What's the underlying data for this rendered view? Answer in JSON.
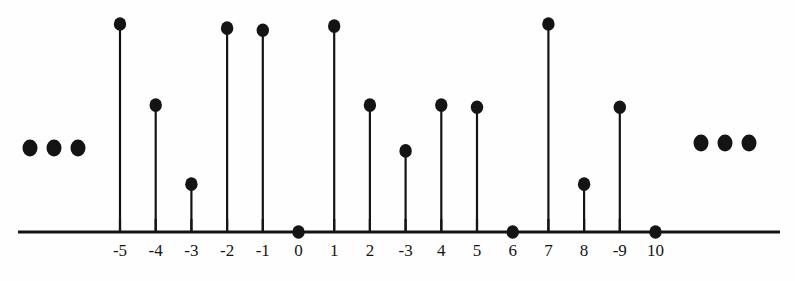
{
  "chart_data": {
    "type": "scatter",
    "plot_style": "stem",
    "title": "",
    "subtitle": "",
    "xlabel": "",
    "ylabel": "",
    "grid": false,
    "legend": null,
    "axis": {
      "baseline_visible": true,
      "ticks_visible": true,
      "y_axis_visible": false,
      "xlim": [
        -6.2,
        11.5
      ],
      "ylim": [
        0,
        1.05
      ]
    },
    "tick_labels": [
      "-5",
      "-4",
      "-3",
      "-2",
      "-1",
      "0",
      "1",
      "2",
      "-3",
      "4",
      "5",
      "6",
      "7",
      "8",
      "-9",
      "10"
    ],
    "categories": [
      "-5",
      "-4",
      "-3",
      "-2",
      "-1",
      "0",
      "1",
      "2",
      "-3",
      "4",
      "5",
      "6",
      "7",
      "8",
      "-9",
      "10"
    ],
    "x": [
      -5,
      -4,
      -3,
      -2,
      -1,
      0,
      1,
      2,
      3,
      4,
      5,
      6,
      7,
      8,
      9,
      10
    ],
    "values": [
      1.0,
      0.61,
      0.23,
      0.98,
      0.97,
      0.0,
      0.99,
      0.61,
      0.39,
      0.61,
      0.6,
      0.0,
      1.0,
      0.23,
      0.6,
      0.0
    ],
    "markers": "filled-circle",
    "continuation": {
      "left": "...",
      "right": "..."
    }
  },
  "colors": {
    "ink": "#141414",
    "background": "#fefefe"
  }
}
